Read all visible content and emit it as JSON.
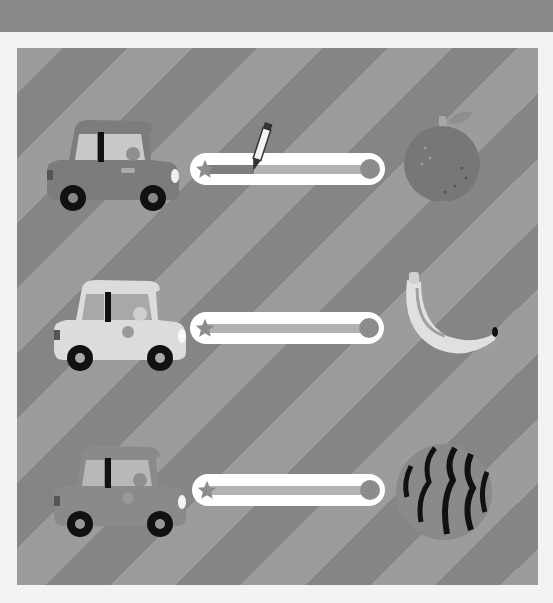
{
  "game": {
    "title": "Match the car to the fruit",
    "instruction": "Trace the line from each car to its fruit"
  },
  "colors": {
    "top_bar": "#8a8a8a",
    "page_bg": "#f3f3f3",
    "stripe_light": "#9c9c9c",
    "stripe_dark": "#858585",
    "track": "#ffffff",
    "lane": "#b2b2b2",
    "lane_done": "#7e7e7e"
  },
  "rows": [
    {
      "car": "car-dark-gray",
      "track_progress_pct": 33,
      "fruit": "orange",
      "fruit_icon": "orange-icon",
      "active": true
    },
    {
      "car": "car-light",
      "track_progress_pct": 0,
      "fruit": "banana",
      "fruit_icon": "banana-icon",
      "active": false
    },
    {
      "car": "car-dark-gray",
      "track_progress_pct": 0,
      "fruit": "watermelon",
      "fruit_icon": "watermelon-icon",
      "active": false
    }
  ],
  "cursor": {
    "tool": "crayon",
    "icon": "crayon-icon"
  }
}
